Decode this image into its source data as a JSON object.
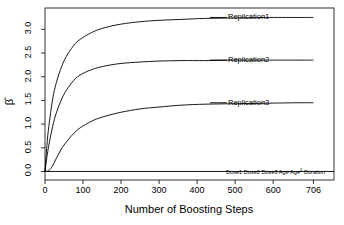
{
  "chart_data": {
    "type": "line",
    "title": "",
    "xlabel": "Number of Boosting Steps",
    "ylabel": "β̂",
    "xlim": [
      0,
      760
    ],
    "ylim": [
      -0.18,
      3.45
    ],
    "xticks": [
      0,
      100,
      200,
      300,
      400,
      500,
      600,
      706
    ],
    "xticklabels": [
      "0",
      "100",
      "200",
      "300",
      "400",
      "500",
      "600",
      "706"
    ],
    "yticks": [
      0.0,
      0.5,
      1.0,
      1.5,
      2.0,
      2.5,
      3.0
    ],
    "yticklabels": [
      "0.0",
      "0.5",
      "1.0",
      "1.5",
      "2.0",
      "2.5",
      "3.0"
    ],
    "grid": false,
    "legend": "inline-right-of-curve-ends",
    "line_color": "#000000",
    "series": [
      {
        "name": "Replication1",
        "label": "Replication1",
        "plateau": 3.25,
        "x": [
          0,
          5,
          10,
          20,
          30,
          45,
          60,
          80,
          100,
          130,
          160,
          200,
          250,
          300,
          360,
          420,
          500,
          580,
          660,
          706
        ],
        "values": [
          0.0,
          0.55,
          0.95,
          1.52,
          1.88,
          2.24,
          2.48,
          2.7,
          2.83,
          2.96,
          3.04,
          3.11,
          3.16,
          3.19,
          3.21,
          3.23,
          3.24,
          3.25,
          3.25,
          3.25
        ]
      },
      {
        "name": "Replication2",
        "label": "Replication2",
        "plateau": 2.35,
        "x": [
          0,
          5,
          10,
          20,
          30,
          45,
          60,
          80,
          100,
          130,
          160,
          200,
          250,
          300,
          360,
          420,
          500,
          580,
          660,
          706
        ],
        "values": [
          0.0,
          0.3,
          0.55,
          0.95,
          1.24,
          1.55,
          1.76,
          1.96,
          2.07,
          2.17,
          2.23,
          2.28,
          2.31,
          2.33,
          2.34,
          2.34,
          2.35,
          2.35,
          2.35,
          2.35
        ]
      },
      {
        "name": "Replication3",
        "label": "Replication3",
        "plateau": 1.45,
        "x": [
          0,
          10,
          20,
          30,
          45,
          60,
          80,
          100,
          130,
          160,
          200,
          250,
          300,
          360,
          420,
          500,
          580,
          660,
          706
        ],
        "values": [
          0.0,
          0.02,
          0.12,
          0.28,
          0.5,
          0.66,
          0.84,
          0.96,
          1.09,
          1.17,
          1.25,
          1.32,
          1.36,
          1.4,
          1.42,
          1.43,
          1.44,
          1.45,
          1.45
        ]
      }
    ],
    "flat_series": {
      "value": 0.0,
      "labels": [
        "Dose1",
        "Dose2",
        "Dose3",
        "Age",
        "Age",
        "Duration"
      ],
      "label_text": "Dose1 Dose2 Dose3 Age Age² Duration",
      "age_squared_superscript": "2"
    }
  }
}
